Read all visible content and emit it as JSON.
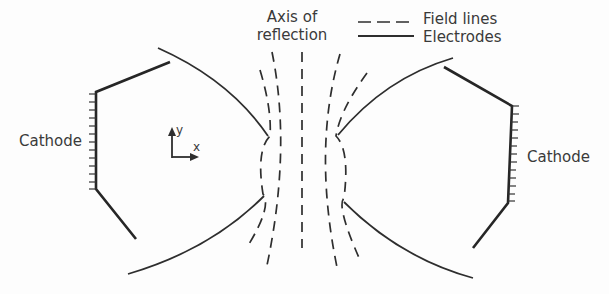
{
  "diagram": {
    "axis_label_line1": "Axis of",
    "axis_label_line2": "reflection",
    "legend": [
      {
        "style": "dashed",
        "label": "Field lines"
      },
      {
        "style": "solid",
        "label": "Electrodes"
      }
    ],
    "left_cathode_label": "Cathode",
    "right_cathode_label": "Cathode",
    "axes_indicator": {
      "y_label": "y",
      "x_label": "x"
    },
    "colors": {
      "ink": "#2e2e2e",
      "background": "#fdfdfd"
    }
  }
}
